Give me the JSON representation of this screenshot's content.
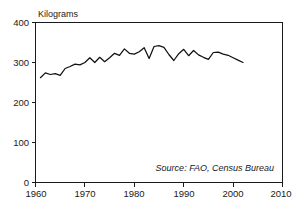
{
  "chart_data": {
    "type": "line",
    "title": "",
    "subtitle": "",
    "xlabel": "",
    "ylabel": "Kilograms",
    "ylabel_position": "above-axis-top-left",
    "xlim": [
      1960,
      2010
    ],
    "ylim": [
      0,
      400
    ],
    "grid": false,
    "legend": null,
    "legend_position": "none",
    "y_ticks": [
      0,
      100,
      200,
      300,
      400
    ],
    "y_tick_labels": [
      "0",
      "100",
      "200",
      "300",
      "400"
    ],
    "x_ticks": [
      1960,
      1970,
      1980,
      1990,
      2000,
      2010
    ],
    "x_tick_labels": [
      "1960",
      "1970",
      "1980",
      "1990",
      "2000",
      "2010"
    ],
    "annotations": [
      {
        "name": "source-note",
        "text": "Source: FAO, Census Bureau",
        "style": "italic",
        "x": 2001,
        "y": 28
      }
    ],
    "series": [
      {
        "name": "Grain production per person",
        "color": "#111111",
        "x": [
          1961,
          1962,
          1963,
          1964,
          1965,
          1966,
          1967,
          1968,
          1969,
          1970,
          1971,
          1972,
          1973,
          1974,
          1975,
          1976,
          1977,
          1978,
          1979,
          1980,
          1981,
          1982,
          1983,
          1984,
          1985,
          1986,
          1987,
          1988,
          1989,
          1990,
          1991,
          1992,
          1993,
          1994,
          1995,
          1996,
          1997,
          1998,
          1999,
          2000,
          2001,
          2002
        ],
        "values": [
          262,
          274,
          270,
          272,
          268,
          285,
          290,
          296,
          294,
          300,
          312,
          300,
          313,
          302,
          312,
          323,
          318,
          334,
          323,
          321,
          327,
          337,
          310,
          340,
          342,
          338,
          320,
          305,
          322,
          333,
          317,
          330,
          319,
          313,
          308,
          325,
          326,
          321,
          318,
          312,
          306,
          300
        ]
      }
    ]
  },
  "figure": {
    "background_color": "#ffffff",
    "line_color": "#111111",
    "text_color": "#1a1a1a"
  }
}
